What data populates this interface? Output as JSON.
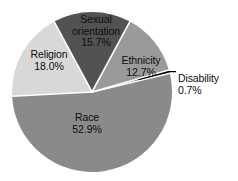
{
  "chart_data": {
    "type": "pie",
    "title": "",
    "subtitle": "",
    "xlabel": "",
    "ylabel": "",
    "legend_position": "none",
    "grid": false,
    "units": "percent",
    "total": 100.0,
    "start_angle_deg": 90,
    "direction": "clockwise",
    "categories": [
      "Race",
      "Religion",
      "Sexual orientation",
      "Ethnicity",
      "Disability"
    ],
    "values": [
      52.9,
      18.0,
      15.7,
      12.7,
      0.7
    ],
    "slices": [
      {
        "label": "Race",
        "value": 52.9,
        "value_text": "52.9%",
        "color": "#8a8a8a",
        "label_placement": "inside"
      },
      {
        "label": "Religion",
        "value": 18.0,
        "value_text": "18.0%",
        "color": "#d8d8d8",
        "label_placement": "inside"
      },
      {
        "label": "Sexual orientation",
        "value": 15.7,
        "value_text": "15.7%",
        "color": "#525252",
        "label_placement": "inside"
      },
      {
        "label": "Ethnicity",
        "value": 12.7,
        "value_text": "12.7%",
        "color": "#9a9a9a",
        "label_placement": "inside"
      },
      {
        "label": "Disability",
        "value": 0.7,
        "value_text": "0.7%",
        "color": "#3a3a3a",
        "label_placement": "outside-callout"
      }
    ]
  },
  "style": {
    "background": "#ffffff",
    "separator_color": "#ffffff",
    "text_color": "#0d0d0d",
    "leader_line_color": "#000000"
  }
}
